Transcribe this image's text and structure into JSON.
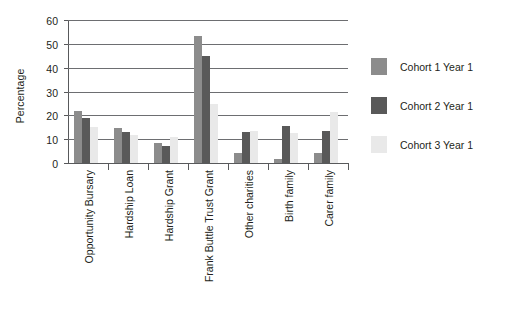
{
  "chart_data": {
    "type": "bar",
    "title": "",
    "subtitle": "",
    "xlabel": "",
    "ylabel": "Percentage",
    "ylim": [
      0,
      60
    ],
    "ytick_values": [
      0,
      10,
      20,
      30,
      40,
      50,
      60
    ],
    "ytick_labels": [
      "0",
      "10",
      "20",
      "30",
      "40",
      "50",
      "60"
    ],
    "grid": true,
    "legend_position": "right",
    "orientation": "vertical",
    "grouping": "grouped",
    "categories": [
      "Opportunity Bursary",
      "Hardship Loan",
      "Hardship Grant",
      "Frank Buttle Trust Grant",
      "Other charities",
      "Birth family",
      "Carer family"
    ],
    "series": [
      {
        "name": "Cohort 1 Year 1",
        "color": "#8c8c8c",
        "values": [
          22,
          14.5,
          8.5,
          53.5,
          4,
          1.7,
          4.3
        ]
      },
      {
        "name": "Cohort 2 Year 1",
        "color": "#595959",
        "values": [
          19,
          13.2,
          7.2,
          45,
          13,
          15.4,
          13.3
        ]
      },
      {
        "name": "Cohort 3 Year 1",
        "color": "#e9e9e9",
        "values": [
          15,
          11.6,
          10.8,
          24.8,
          13.6,
          12.6,
          21.5
        ]
      }
    ]
  },
  "legend": {
    "entries": [
      {
        "label": "Cohort 1 Year 1",
        "color": "#8c8c8c"
      },
      {
        "label": "Cohort 2 Year 1",
        "color": "#595959"
      },
      {
        "label": "Cohort 3 Year 1",
        "color": "#e9e9e9"
      }
    ]
  }
}
